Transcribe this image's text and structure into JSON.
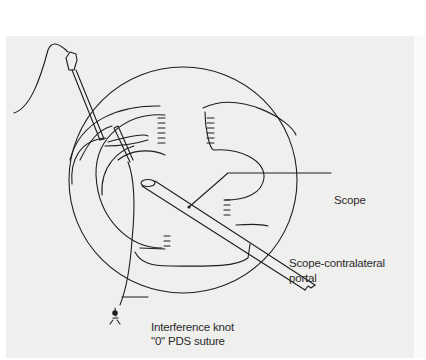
{
  "figure": {
    "background": "#efefed",
    "line_color": "#1e1e1e",
    "labels": {
      "scope": "Scope",
      "portal_line1": "Scope-contralateral",
      "portal_line2": "portal",
      "knot_line1": "Interference knot",
      "knot_line2": "\"0\" PDS suture"
    }
  }
}
